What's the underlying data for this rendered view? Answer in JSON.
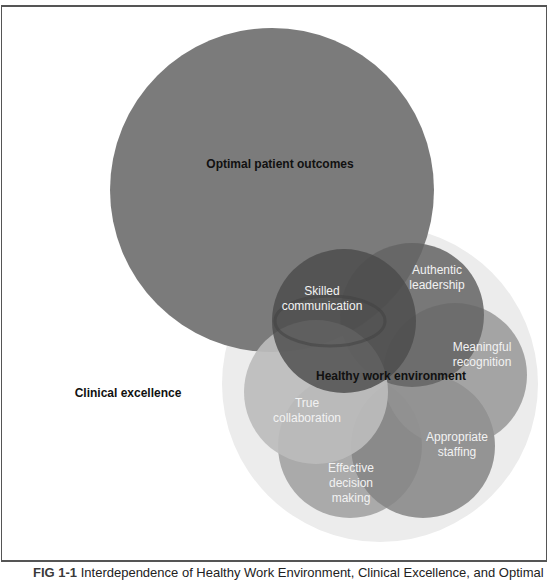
{
  "figure": {
    "caption_label": "FIG 1-1",
    "caption_text": "Interdependence of Healthy Work Environment, Clinical Excellence, and Optimal"
  },
  "diagram": {
    "outer": {
      "optimal_outcomes": {
        "label": "Optimal patient outcomes",
        "cx": 272,
        "cy": 190,
        "r": 162,
        "color": "#7b7b7b"
      },
      "clinical_excellence": {
        "label": "Clinical excellence",
        "cx": 380,
        "cy": 384,
        "r": 158,
        "color": "#ececec"
      }
    },
    "hwe_label": "Healthy work environment",
    "standards": [
      {
        "id": "skilled-communication",
        "lines": [
          "Skilled",
          "communication"
        ],
        "cx": 344,
        "cy": 321,
        "r": 72,
        "color": "#555555"
      },
      {
        "id": "authentic-leadership",
        "lines": [
          "Authentic",
          "leadership"
        ],
        "cx": 412,
        "cy": 315,
        "r": 72,
        "color": "#6c6c6c"
      },
      {
        "id": "meaningful-recognition",
        "lines": [
          "Meaningful",
          "recognition"
        ],
        "cx": 455,
        "cy": 375,
        "r": 72,
        "color": "#9a9a9a"
      },
      {
        "id": "appropriate-staffing",
        "lines": [
          "Appropriate",
          "staffing"
        ],
        "cx": 423,
        "cy": 446,
        "r": 72,
        "color": "#8b8b8b"
      },
      {
        "id": "effective-decision-making",
        "lines": [
          "Effective",
          "decision",
          "making"
        ],
        "cx": 350,
        "cy": 446,
        "r": 72,
        "color": "#a9a9a9"
      },
      {
        "id": "true-collaboration",
        "lines": [
          "True",
          "collaboration"
        ],
        "cx": 316,
        "cy": 392,
        "r": 72,
        "color": "#b9b9b9"
      }
    ]
  }
}
